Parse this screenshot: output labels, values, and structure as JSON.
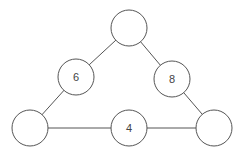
{
  "diagram": {
    "type": "number-triangle",
    "stroke_color": "#555555",
    "nodes": [
      {
        "id": "top",
        "label": "",
        "cx": 129,
        "cy": 28,
        "r": 18
      },
      {
        "id": "left-mid",
        "label": "6",
        "cx": 76,
        "cy": 77,
        "r": 18
      },
      {
        "id": "right-mid",
        "label": "8",
        "cx": 172,
        "cy": 79,
        "r": 18
      },
      {
        "id": "bottom-left",
        "label": "",
        "cx": 30,
        "cy": 128,
        "r": 18
      },
      {
        "id": "bottom-mid",
        "label": "4",
        "cx": 129,
        "cy": 128,
        "r": 18
      },
      {
        "id": "bottom-right",
        "label": "",
        "cx": 214,
        "cy": 128,
        "r": 18
      }
    ],
    "edges": [
      [
        "top",
        "left-mid"
      ],
      [
        "left-mid",
        "bottom-left"
      ],
      [
        "top",
        "right-mid"
      ],
      [
        "right-mid",
        "bottom-right"
      ],
      [
        "bottom-left",
        "bottom-mid"
      ],
      [
        "bottom-mid",
        "bottom-right"
      ]
    ]
  }
}
